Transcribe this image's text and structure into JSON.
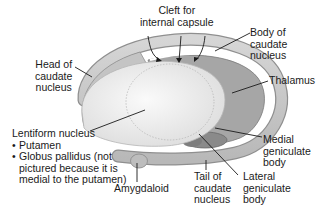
{
  "diagram": {
    "type": "anatomical illustration",
    "colors": {
      "background": "#ffffff",
      "caudate": "#c9c9c9",
      "caudate_edge": "#8f8f8f",
      "putamen": "#ececec",
      "putamen_highlight": "#f7f7f7",
      "thalamus": "#9e9e9e",
      "geniculate": "#8a8a8a",
      "leader_line": "#1a1a1a"
    },
    "labels": {
      "cleft": [
        "Cleft for",
        "internal capsule"
      ],
      "body_caudate": [
        "Body of",
        "caudate",
        "nucleus"
      ],
      "head_caudate": [
        "Head of",
        "caudate",
        "nucleus"
      ],
      "thalamus": "Thalamus",
      "lentiform": {
        "title": "Lentiform nucleus",
        "items": [
          [
            "Putamen"
          ],
          [
            "Globus pallidus (not",
            "pictured because it is",
            "medial to the putamen)"
          ]
        ]
      },
      "medial_geniculate": [
        "Medial",
        "geniculate",
        "body"
      ],
      "lateral_geniculate": [
        "Lateral",
        "geniculate",
        "body"
      ],
      "tail_caudate": [
        "Tail of",
        "caudate",
        "nucleus"
      ],
      "amygdaloid": "Amygdaloid"
    }
  }
}
